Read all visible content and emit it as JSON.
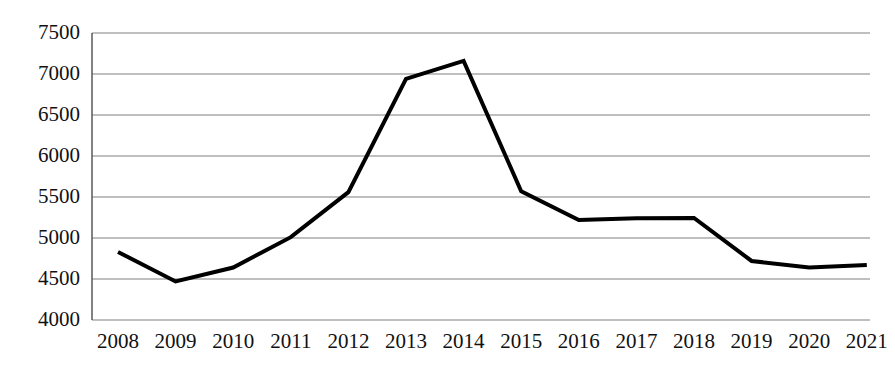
{
  "chart_data": {
    "type": "line",
    "title": "",
    "subtitle": "",
    "xlabel": "",
    "ylabel": "",
    "categories": [
      "2008",
      "2009",
      "2010",
      "2011",
      "2012",
      "2013",
      "2014",
      "2015",
      "2016",
      "2017",
      "2018",
      "2019",
      "2020",
      "2021"
    ],
    "values": [
      4830,
      4470,
      4640,
      5010,
      5560,
      6940,
      7160,
      5570,
      5220,
      5240,
      5245,
      4720,
      4640,
      4670
    ],
    "series": [
      {
        "name": "",
        "values": [
          4830,
          4470,
          4640,
          5010,
          5560,
          6940,
          7160,
          5570,
          5220,
          5240,
          5245,
          4720,
          4640,
          4670
        ]
      }
    ],
    "ylim": [
      4000,
      7500
    ],
    "ytick_values": [
      4000,
      4500,
      5000,
      5500,
      6000,
      6500,
      7000,
      7500
    ],
    "ytick_labels": [
      "4000",
      "4500",
      "5000",
      "5500",
      "6000",
      "6500",
      "7000",
      "7500"
    ],
    "xtick_labels": [
      "2008",
      "2009",
      "2010",
      "2011",
      "2012",
      "2013",
      "2014",
      "2015",
      "2016",
      "2017",
      "2018",
      "2019",
      "2020",
      "2021"
    ],
    "grid": true,
    "grid_axis": "y",
    "legend": false,
    "legend_position": "none",
    "markers": false,
    "line_color": "#000000",
    "line_width": 4,
    "grid_color": "#808080",
    "axis_color": "#4d4d4d",
    "background_color": "#ffffff",
    "annotations": []
  },
  "layout": {
    "plot_left": 92,
    "plot_right": 870,
    "plot_top": 33,
    "plot_bottom": 320,
    "x_first": 118,
    "x_step": 57.6,
    "xtick_label_y": 331
  }
}
